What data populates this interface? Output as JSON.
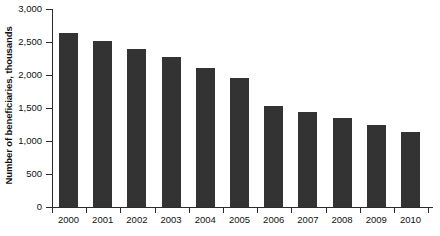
{
  "chart_data": {
    "type": "bar",
    "title": "",
    "subtitle": "",
    "xlabel": "",
    "ylabel": "Number of beneficiaries, thousands",
    "categories": [
      "2000",
      "2001",
      "2002",
      "2003",
      "2004",
      "2005",
      "2006",
      "2007",
      "2008",
      "2009",
      "2010"
    ],
    "values": [
      2640,
      2520,
      2390,
      2270,
      2100,
      1950,
      1530,
      1440,
      1345,
      1250,
      1130
    ],
    "series": [
      {
        "name": "Number of beneficiaries",
        "values": [
          2640,
          2520,
          2390,
          2270,
          2100,
          1950,
          1530,
          1440,
          1345,
          1250,
          1130
        ]
      }
    ],
    "ylim": [
      0,
      3000
    ],
    "ytick_labels": [
      "0",
      "500",
      "1,000",
      "1,500",
      "2,000",
      "2,500",
      "3,000"
    ],
    "ytick_values": [
      0,
      500,
      1000,
      1500,
      2000,
      2500,
      3000
    ],
    "grid": false,
    "legend": false,
    "legend_position": "none",
    "bar_color": "#333333",
    "axis_color": "#2b2b2b",
    "background_color": "#ffffff"
  }
}
